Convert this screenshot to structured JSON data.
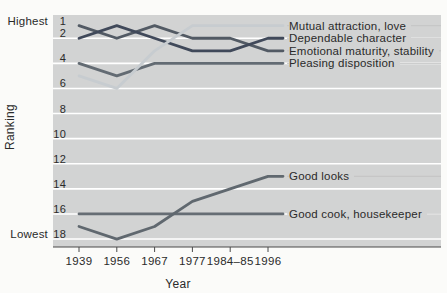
{
  "chart_data": {
    "type": "line",
    "title": "",
    "xlabel": "Year",
    "ylabel": "Ranking",
    "x_categories": [
      "1939",
      "1956",
      "1967",
      "1977",
      "1984–85",
      "1996"
    ],
    "y_tick_labels": [
      "1",
      "2",
      "4",
      "6",
      "8",
      "10",
      "12",
      "14",
      "16",
      "18"
    ],
    "y_top_annotation": "Highest",
    "y_bottom_annotation": "Lowest",
    "ylim": [
      1,
      18
    ],
    "y_axis_inverted": true,
    "grid": "horizontal white gridlines at even ranks on gray panel",
    "legend_position": "right of line ends",
    "panel_color": "#d2d3d3",
    "background_color": "#fbfbf9",
    "gridline_color": "#ffffff",
    "legend_rule_color": "#c3c4c4",
    "axis_line_color": "#4a4a4a",
    "text_color": "#2a2a2a",
    "series": [
      {
        "name": "Mutual attraction, love",
        "color": "#c7ccd0",
        "values": [
          5,
          6,
          3,
          1,
          1,
          1
        ]
      },
      {
        "name": "Dependable character",
        "color": "#40495a",
        "values": [
          2,
          1,
          2,
          3,
          3,
          2
        ]
      },
      {
        "name": "Emotional maturity, stability",
        "color": "#525a64",
        "values": [
          1,
          2,
          1,
          2,
          2,
          3
        ]
      },
      {
        "name": "Pleasing disposition",
        "color": "#636b73",
        "values": [
          4,
          5,
          4,
          4,
          4,
          4
        ]
      },
      {
        "name": "Good looks",
        "color": "#60686f",
        "values": [
          17,
          18,
          17,
          15,
          14,
          13
        ]
      },
      {
        "name": "Good cook, housekeeper",
        "color": "#666d74",
        "values": [
          16,
          16,
          16,
          16,
          16,
          16
        ]
      }
    ]
  }
}
